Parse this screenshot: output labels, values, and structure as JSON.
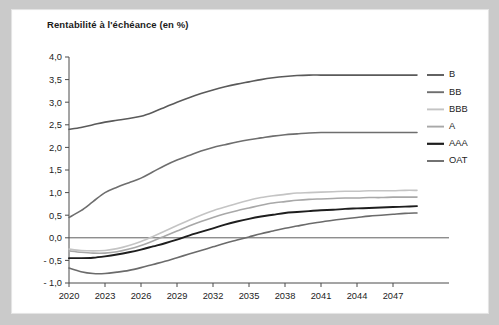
{
  "chart_data": {
    "type": "line",
    "title": "Rentabilité à l'échéance (en %)",
    "xlabel": "",
    "ylabel": "",
    "ylim": [
      -1.0,
      4.0
    ],
    "xlim": [
      2020,
      2049
    ],
    "grid": false,
    "legend_position": "right",
    "yticks": [
      "4,0",
      "3,5",
      "3,0",
      "2,5",
      "2,0",
      "1,5",
      "1,0",
      "0,5",
      "0,0",
      "- 0,5",
      "- 1,0"
    ],
    "ytick_values": [
      4.0,
      3.5,
      3.0,
      2.5,
      2.0,
      1.5,
      1.0,
      0.5,
      0.0,
      -0.5,
      -1.0
    ],
    "xticks": [
      "2020",
      "2023",
      "2026",
      "2029",
      "2032",
      "2035",
      "2038",
      "2041",
      "2044",
      "2047"
    ],
    "xtick_values": [
      2020,
      2023,
      2026,
      2029,
      2032,
      2035,
      2038,
      2041,
      2044,
      2047
    ],
    "x": [
      2020,
      2021,
      2022,
      2023,
      2024,
      2025,
      2026,
      2027,
      2028,
      2029,
      2030,
      2031,
      2032,
      2033,
      2034,
      2035,
      2036,
      2037,
      2038,
      2039,
      2040,
      2041,
      2042,
      2043,
      2044,
      2045,
      2046,
      2047,
      2048,
      2049
    ],
    "series": [
      {
        "name": "B",
        "color": "#5a5a5a",
        "width": 1.6,
        "values": [
          2.4,
          2.44,
          2.5,
          2.56,
          2.6,
          2.64,
          2.69,
          2.78,
          2.89,
          3.0,
          3.1,
          3.19,
          3.27,
          3.34,
          3.4,
          3.45,
          3.5,
          3.54,
          3.57,
          3.59,
          3.6,
          3.6,
          3.6,
          3.6,
          3.6,
          3.6,
          3.6,
          3.6,
          3.6,
          3.6
        ]
      },
      {
        "name": "BB",
        "color": "#6e6e6e",
        "width": 1.6,
        "values": [
          0.45,
          0.6,
          0.8,
          1.0,
          1.12,
          1.22,
          1.32,
          1.46,
          1.6,
          1.72,
          1.82,
          1.92,
          2.0,
          2.06,
          2.12,
          2.17,
          2.21,
          2.25,
          2.28,
          2.3,
          2.32,
          2.33,
          2.33,
          2.33,
          2.33,
          2.33,
          2.33,
          2.33,
          2.33,
          2.33
        ]
      },
      {
        "name": "BBB",
        "color": "#c4c4c4",
        "width": 1.6,
        "values": [
          -0.25,
          -0.28,
          -0.29,
          -0.28,
          -0.24,
          -0.17,
          -0.08,
          0.03,
          0.15,
          0.27,
          0.39,
          0.5,
          0.6,
          0.68,
          0.76,
          0.83,
          0.89,
          0.93,
          0.96,
          0.99,
          1.0,
          1.01,
          1.02,
          1.03,
          1.03,
          1.04,
          1.04,
          1.04,
          1.05,
          1.05
        ]
      },
      {
        "name": "A",
        "color": "#a8a8a8",
        "width": 1.6,
        "values": [
          -0.29,
          -0.32,
          -0.34,
          -0.34,
          -0.31,
          -0.25,
          -0.17,
          -0.07,
          0.04,
          0.15,
          0.26,
          0.36,
          0.45,
          0.53,
          0.6,
          0.66,
          0.72,
          0.77,
          0.8,
          0.83,
          0.85,
          0.86,
          0.87,
          0.88,
          0.88,
          0.89,
          0.89,
          0.9,
          0.9,
          0.9
        ]
      },
      {
        "name": "AAA",
        "color": "#1e1e1e",
        "width": 1.9,
        "values": [
          -0.45,
          -0.45,
          -0.44,
          -0.41,
          -0.37,
          -0.32,
          -0.26,
          -0.19,
          -0.12,
          -0.04,
          0.05,
          0.13,
          0.21,
          0.29,
          0.36,
          0.42,
          0.47,
          0.51,
          0.55,
          0.57,
          0.59,
          0.61,
          0.62,
          0.64,
          0.65,
          0.66,
          0.67,
          0.68,
          0.69,
          0.7
        ]
      },
      {
        "name": "OAT",
        "color": "#6b6b6b",
        "width": 1.6,
        "values": [
          -0.67,
          -0.75,
          -0.79,
          -0.79,
          -0.76,
          -0.72,
          -0.66,
          -0.59,
          -0.52,
          -0.44,
          -0.36,
          -0.28,
          -0.2,
          -0.12,
          -0.05,
          0.02,
          0.09,
          0.15,
          0.21,
          0.26,
          0.31,
          0.35,
          0.39,
          0.42,
          0.45,
          0.48,
          0.5,
          0.52,
          0.54,
          0.55
        ]
      }
    ]
  },
  "legend": {
    "items": [
      {
        "label": "B"
      },
      {
        "label": "BB"
      },
      {
        "label": "BBB"
      },
      {
        "label": "A"
      },
      {
        "label": "AAA"
      },
      {
        "label": "OAT"
      }
    ]
  },
  "colors": {
    "background": "#cacaca",
    "card": "#ffffff",
    "axis": "#4a4a4a",
    "text": "#1d1d1d"
  }
}
